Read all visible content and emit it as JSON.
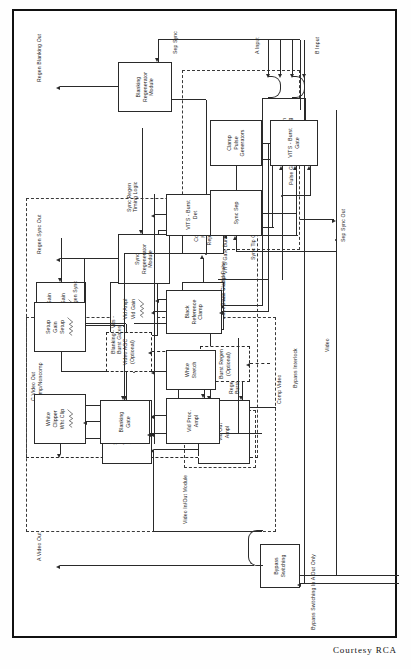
{
  "figure": {
    "caption": "Courtesy  RCA",
    "orientation": "rotated-90-ccw",
    "frame_color": "#111111"
  },
  "io_labels": {
    "a_video_out": "A Video Out",
    "b_video_out": "B Video Out",
    "c_video_out": "C Video Out\nComp/Noncomp",
    "regen_sync_out": "Regen Sync Out",
    "regen_blanking_out": "Regen Blanking Out",
    "sep_sync_out": "Sep Sync Out",
    "a_input": "A Input",
    "b_input": "B Input"
  },
  "modules": [
    {
      "id": "video-in-out-module",
      "label": "Video In/Out Module"
    },
    {
      "id": "burst-regen-module",
      "label": "Burst Regen\n(Optional)"
    },
    {
      "id": "video-proc-module",
      "label": "Video Proc. Module"
    },
    {
      "id": "pulse-gate-module",
      "label": "Pulse Gate Module"
    }
  ],
  "blocks": [
    {
      "id": "bypass-switching",
      "label": "Bypass\nSwitching"
    },
    {
      "id": "input-selection-switching",
      "label": "Input\nSelection\nSwitching"
    },
    {
      "id": "common-mode-reject-ampl",
      "label": "Common\nMode\nReject Ampl"
    },
    {
      "id": "hum-and-tilt-reject-clamp",
      "label": "Hum and Tilt\nReject Clamp"
    },
    {
      "id": "vid-ampl",
      "label": "Vid Ampl",
      "control": "Vid Gain",
      "has_pot": true
    },
    {
      "id": "chroma-gain-ampl",
      "label": "Chroma Gain\nAmpl",
      "control": "Chroma Gain",
      "has_pot": true
    },
    {
      "id": "vid-out-ampl",
      "label": "Vid Out\nAmpl"
    },
    {
      "id": "sync-ampl-and-adder",
      "label": "Sync Ampl\nAnd Adder",
      "control": "Sync Gain",
      "has_pot": true
    },
    {
      "id": "burst-regen",
      "label": "Burst Regen\n(Optional)",
      "dashed": true
    },
    {
      "id": "video-agc",
      "label": "Video AGC\n(Optional)",
      "dashed": true
    },
    {
      "id": "sync-regenerator-module",
      "label": "Sync\nRegenerator\nModule"
    },
    {
      "id": "blanking-regenerator-module",
      "label": "Blanking\nRegenerator\nModule"
    },
    {
      "id": "white-clipper",
      "label": "White\nClipper",
      "control": "Wht Clip",
      "has_pot": true
    },
    {
      "id": "setup-gain",
      "label": "Setup\nGain",
      "control": "Setup",
      "has_pot": true
    },
    {
      "id": "blanking-gate",
      "label": "Blanking\nGate"
    },
    {
      "id": "vid-proc-ampl",
      "label": "Vid Proc.\nAmpl"
    },
    {
      "id": "white-stretch",
      "label": "White\nStretch"
    },
    {
      "id": "black-reference-clamp",
      "label": "Black\nReference\nClamp"
    },
    {
      "id": "vits-burst-det",
      "label": "VITS - Burst\nDet"
    },
    {
      "id": "sync-sep",
      "label": "Sync Sep"
    },
    {
      "id": "clamp-pulse-generators",
      "label": "Clamp\nPulse\nGenerators"
    },
    {
      "id": "vits-burst-gate",
      "label": "VITS - Burst\nGate"
    }
  ],
  "signal_labels": [
    {
      "id": "bypass-switching-in-a-out-only",
      "text": "Bypass Switching In A Out Only"
    },
    {
      "id": "bypass-interlock",
      "text": "Bypass Interlock"
    },
    {
      "id": "video",
      "text": "Video"
    },
    {
      "id": "comp-video",
      "text": "Comp Video"
    },
    {
      "id": "noncomp-video",
      "text": "Noncomp Video"
    },
    {
      "id": "regen-burst",
      "text": "Regen\nBurst"
    },
    {
      "id": "regen-sync",
      "text": "Regen Sync"
    },
    {
      "id": "sync-regen-timing-logic",
      "text": "Sync Regen\nTiming Logic"
    },
    {
      "id": "sep-sync",
      "text": "Sep Sync"
    },
    {
      "id": "blanking-vits-burst-gates",
      "text": "Blanking - Vits -\nBurst Gates"
    },
    {
      "id": "sync-tip-clamp-pulse",
      "text": "Sync Tip Clamp Pulse"
    },
    {
      "id": "black-clamp-pulse",
      "text": "Black Clamp Pulse"
    },
    {
      "id": "vits-gate-burst",
      "text": "VITS Gate Burst"
    }
  ]
}
